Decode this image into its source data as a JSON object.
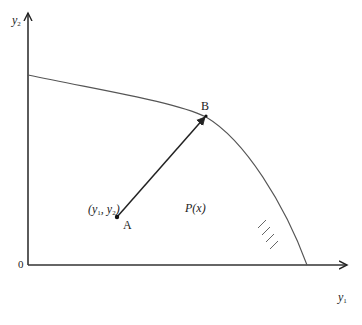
{
  "diagram": {
    "type": "production-possibility frontier",
    "colors": {
      "axis": "#333333",
      "curve": "#555555",
      "arrow": "#222222",
      "text": "#222222"
    },
    "axes": {
      "y_label": "y",
      "y_label_sub": "2",
      "x_label": "y",
      "x_label_sub": "1",
      "origin_label": "0"
    },
    "points": {
      "A": {
        "label": "A",
        "coord_label_open": "(y",
        "coord_sub1": "1",
        "coord_mid": ", y",
        "coord_sub2": "2",
        "coord_close": ")"
      },
      "B": {
        "label": "B"
      }
    },
    "region_label": "P(x)",
    "curve": {
      "start": [
        28,
        75
      ],
      "through_B": [
        206,
        116
      ],
      "end_on_x_axis": [
        307,
        265
      ]
    },
    "hatch_marks": 4
  }
}
